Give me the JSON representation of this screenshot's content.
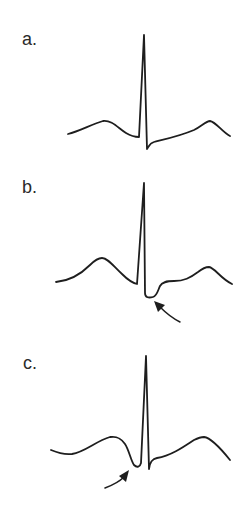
{
  "figure": {
    "panels": [
      {
        "id": "a",
        "label": "a.",
        "description": "Normal ECG complex: P wave, narrow tall R wave, small S, upright T wave",
        "trace_path": "M68,134 C80,131 92,124 103,121 C112,120 118,128 126,133 C131,136 135,137 139,137 L144,35 L147,149 C149,146 150,143 154,142 C166,139 180,136 194,130 C202,126 206,121 210,121 C216,122 222,132 230,136",
        "arrow": null
      },
      {
        "id": "b",
        "label": "b.",
        "description": "ECG complex with deep S wave / ST depression (arrow points to trough after QRS)",
        "trace_path": "M56,282 C68,281 80,275 90,265 C95,260 99,258 102,258 C108,258 114,267 122,274 C128,280 133,283 137,284 L144,183 L145,293 C145,298 149,298 153,297 C157,296 158,290 160,286 C162,282 166,281 174,281 C184,281 190,278 198,272 C203,268 206,267 209,267 C215,268 220,278 232,284",
        "arrow": {
          "shaft": "M180,322 C172,318 166,313 160,307",
          "head": "M154,301 L165,305 L158,312 Z"
        }
      },
      {
        "id": "c",
        "label": "c.",
        "description": "ECG complex with prominent Q wave before R (arrow points to Q trough)",
        "trace_path": "M51,450 C58,453 64,455 72,454 C85,452 96,441 110,437 C117,436 121,438 125,444 C129,450 131,461 134,465 C137,468 140,467 141,463 L146,356 L149,469 C150,462 152,459 157,458 C170,456 182,448 194,440 C198,438 201,437 204,437 C212,438 222,450 230,460",
        "arrow": {
          "shaft": "M105,488 C113,485 119,482 124,477",
          "head": "M129,470 L126,482 L119,476 Z"
        }
      }
    ]
  }
}
